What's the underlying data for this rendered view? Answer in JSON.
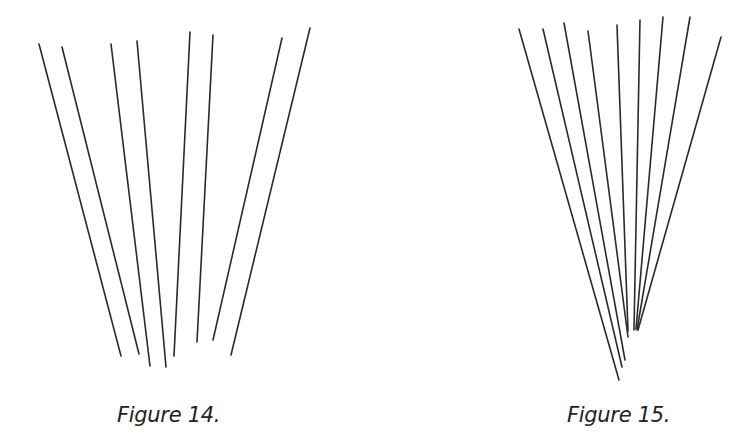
{
  "figures": [
    {
      "caption": "Figure 14.",
      "description": "Eight separate straight lines fanning outward, not converging",
      "line_color": "#2a2a2a",
      "lines": [
        [
          39,
          44,
          121,
          356
        ],
        [
          62,
          47,
          139,
          354
        ],
        [
          111,
          44,
          150,
          366
        ],
        [
          137,
          41,
          166,
          367
        ],
        [
          190,
          32,
          174,
          356
        ],
        [
          213,
          35,
          197,
          342
        ],
        [
          282,
          38,
          213,
          340
        ],
        [
          310,
          28,
          231,
          355
        ]
      ]
    },
    {
      "caption": "Figure 15.",
      "description": "Nine straight lines converging toward a point near the bottom",
      "line_color": "#2a2a2a",
      "lines": [
        [
          519,
          29,
          619,
          380
        ],
        [
          543,
          29,
          622,
          367
        ],
        [
          564,
          23,
          625,
          360
        ],
        [
          588,
          31,
          628,
          337
        ],
        [
          617,
          25,
          628,
          331
        ],
        [
          640,
          20,
          634,
          330
        ],
        [
          663,
          17,
          636,
          329
        ],
        [
          690,
          17,
          637,
          330
        ],
        [
          721,
          37,
          638,
          330
        ]
      ]
    }
  ]
}
